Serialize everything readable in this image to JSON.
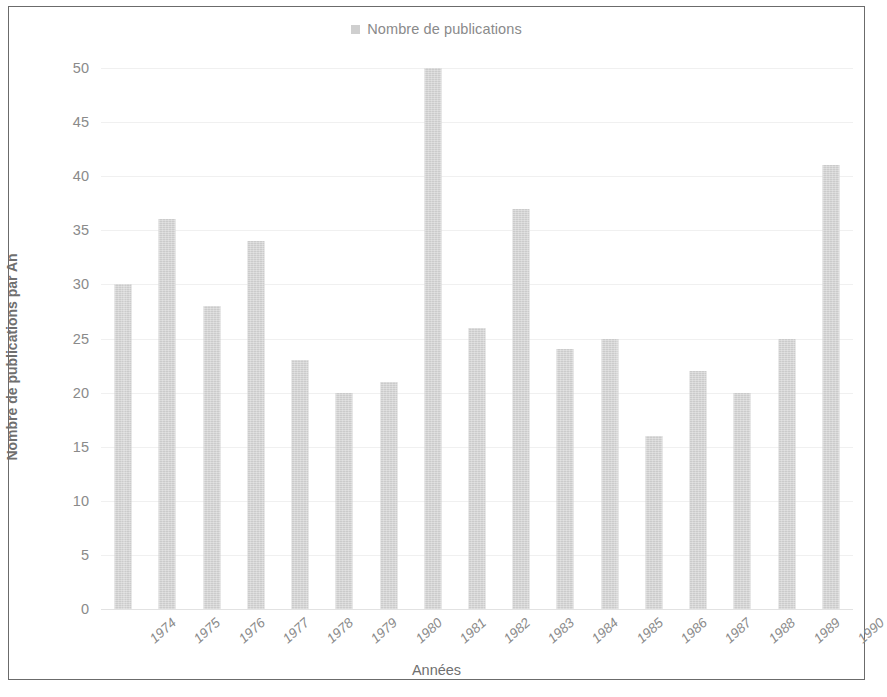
{
  "chart_data": {
    "type": "bar",
    "title": "",
    "xlabel": "Années",
    "ylabel": "Nombre de publications par An",
    "legend": [
      "Nombre de publications"
    ],
    "legend_position": "top-center",
    "grid": true,
    "ylim": [
      0,
      50
    ],
    "ytick_step": 5,
    "yticks": [
      "50",
      "45",
      "40",
      "35",
      "30",
      "25",
      "20",
      "15",
      "10",
      "5",
      "0"
    ],
    "categories": [
      "1974",
      "1975",
      "1976",
      "1977",
      "1978",
      "1979",
      "1980",
      "1981",
      "1982",
      "1983",
      "1984",
      "1985",
      "1986",
      "1987",
      "1988",
      "1989",
      "1990"
    ],
    "values": [
      30,
      36,
      28,
      34,
      23,
      20,
      21,
      50,
      26,
      37,
      24,
      25,
      16,
      22,
      20,
      25,
      41
    ],
    "series": [
      {
        "name": "Nombre de publications",
        "color": "#cbcbcb",
        "values": [
          30,
          36,
          28,
          34,
          23,
          20,
          21,
          50,
          26,
          37,
          24,
          25,
          16,
          22,
          20,
          25,
          41
        ]
      }
    ]
  },
  "legend": {
    "marker_name": "legend-swatch-icon",
    "label": "Nombre de publications",
    "color": "#cbcbcb"
  },
  "axes": {
    "y_title": "Nombre de publications par An",
    "x_title": "Années"
  },
  "colors": {
    "bar": "#cbcbcb",
    "grid": "#f0f0f0",
    "text": "#8a8a8a",
    "frame": "#6b6b6b"
  }
}
